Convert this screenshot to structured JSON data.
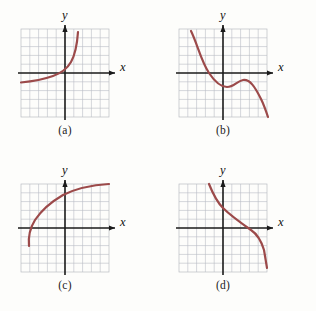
{
  "figure": {
    "background_color": "#fdfdfb",
    "grid_color": "#b9bcc4",
    "axis_color": "#1a1a1a",
    "curve_color": "#9c4a4a"
  },
  "axis_labels": {
    "x": "x",
    "y": "y"
  },
  "panels": [
    {
      "key": "a",
      "caption": "(a)",
      "description": "increasing exponential-type curve, concave up",
      "grid": {
        "cols": 10,
        "rows": 10,
        "cell_px": 8.8
      },
      "origin": {
        "x_cells": 5,
        "y_cells": 5
      },
      "curve_points": "M -3,-11 C 0,-10 10,-8 22,-4 C 30,-1 36,6 40,18 C 42,26 43,34 43.5,44"
    },
    {
      "key": "b",
      "caption": "(b)",
      "description": "cubic with a flat wiggle, increasing overall",
      "grid": {
        "cols": 10,
        "rows": 10,
        "cell_px": 8.8
      },
      "origin": {
        "x_cells": 5,
        "y_cells": 5
      },
      "curve_points": "M -32,-42 C -26,-30 -22,-12 -14,0 C -8,9 -2,14 4,14 C 11,14 14,8 20,7 C 27,6 32,14 38,26 C 41,32 43,38 45,44"
    },
    {
      "key": "c",
      "caption": "(c)",
      "description": "increasing logarithmic-type curve, concave down",
      "grid": {
        "cols": 10,
        "rows": 10,
        "cell_px": 8.8
      },
      "origin": {
        "x_cells": 5,
        "y_cells": 5
      },
      "curve_points": "M -36,18 C -37,8 -35,0 -30,-8 C -24,-17 -14,-26 -2,-33 C 12,-40 28,-43 44,-44"
    },
    {
      "key": "d",
      "caption": "(d)",
      "description": "decreasing curve crossing the x-axis on the right",
      "grid": {
        "cols": 10,
        "rows": 10,
        "cell_px": 8.8
      },
      "origin": {
        "x_cells": 5,
        "y_cells": 5
      },
      "curve_points": "M -14,-44 C -10,-34 -6,-26 0,-20 C 8,-12 18,-5 28,2 C 34,6 38,12 41,22 C 42,28 43,34 44,40"
    }
  ]
}
